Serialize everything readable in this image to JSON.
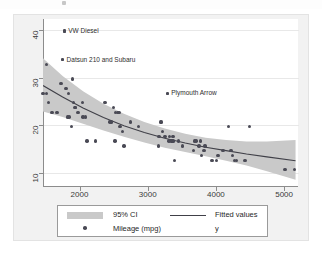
{
  "chart_data": {
    "type": "scatter",
    "title": "",
    "xlabel": "",
    "ylabel": "",
    "xlim": [
      1760,
      4880
    ],
    "ylim": [
      8.4,
      43.5
    ],
    "xticks": [
      2000,
      3000,
      4000,
      5000
    ],
    "yticks": [
      10,
      20,
      30,
      40
    ],
    "grid": "horizontal",
    "legend_position": "bottom",
    "series": [
      {
        "name": "Mileage (mpg)",
        "type": "scatter",
        "marker": "circle",
        "color": "#4a4a55",
        "points": [
          [
            1760,
            28
          ],
          [
            1800,
            28
          ],
          [
            1800,
            34
          ],
          [
            1830,
            26
          ],
          [
            1870,
            24
          ],
          [
            1930,
            24
          ],
          [
            1980,
            30
          ],
          [
            2000,
            35
          ],
          [
            2020,
            41
          ],
          [
            2040,
            29
          ],
          [
            2060,
            23
          ],
          [
            2070,
            28
          ],
          [
            2080,
            23
          ],
          [
            2110,
            21
          ],
          [
            2120,
            31
          ],
          [
            2130,
            26
          ],
          [
            2150,
            25
          ],
          [
            2160,
            25
          ],
          [
            2190,
            24
          ],
          [
            2240,
            26
          ],
          [
            2250,
            23
          ],
          [
            2280,
            23
          ],
          [
            2300,
            18
          ],
          [
            2400,
            18
          ],
          [
            2520,
            26
          ],
          [
            2580,
            22
          ],
          [
            2600,
            22
          ],
          [
            2620,
            25
          ],
          [
            2640,
            18
          ],
          [
            2650,
            24
          ],
          [
            2670,
            24
          ],
          [
            2690,
            24
          ],
          [
            2700,
            21
          ],
          [
            2730,
            20
          ],
          [
            2750,
            17
          ],
          [
            2830,
            22
          ],
          [
            2930,
            21
          ],
          [
            3170,
            17
          ],
          [
            3180,
            19
          ],
          [
            3200,
            22
          ],
          [
            3210,
            22
          ],
          [
            3220,
            20
          ],
          [
            3250,
            19
          ],
          [
            3260,
            19
          ],
          [
            3280,
            28
          ],
          [
            3300,
            18
          ],
          [
            3310,
            19
          ],
          [
            3330,
            18
          ],
          [
            3340,
            18
          ],
          [
            3350,
            19
          ],
          [
            3360,
            18
          ],
          [
            3370,
            14
          ],
          [
            3420,
            18
          ],
          [
            3470,
            17
          ],
          [
            3600,
            16
          ],
          [
            3610,
            18
          ],
          [
            3630,
            18
          ],
          [
            3670,
            17
          ],
          [
            3690,
            18
          ],
          [
            3700,
            15
          ],
          [
            3730,
            16
          ],
          [
            3740,
            17
          ],
          [
            3830,
            14
          ],
          [
            3880,
            14
          ],
          [
            3900,
            15
          ],
          [
            3960,
            16
          ],
          [
            4030,
            21
          ],
          [
            4060,
            16
          ],
          [
            4080,
            15
          ],
          [
            4100,
            14
          ],
          [
            4130,
            14
          ],
          [
            4230,
            14
          ],
          [
            4290,
            21
          ],
          [
            4720,
            12
          ],
          [
            4840,
            12
          ]
        ]
      },
      {
        "name": "Fitted values",
        "type": "line",
        "color": "#404048",
        "points": [
          [
            1760,
            29.6
          ],
          [
            2000,
            27.2
          ],
          [
            2250,
            24.9
          ],
          [
            2500,
            22.9
          ],
          [
            2750,
            21.2
          ],
          [
            3000,
            19.8
          ],
          [
            3250,
            18.6
          ],
          [
            3500,
            17.6
          ],
          [
            3750,
            16.7
          ],
          [
            4000,
            16.0
          ],
          [
            4250,
            15.3
          ],
          [
            4500,
            14.7
          ],
          [
            4850,
            13.9
          ]
        ]
      },
      {
        "name": "95% CI",
        "type": "band",
        "color": "#c9c9c9",
        "upper": [
          [
            1760,
            35.3
          ],
          [
            2000,
            31.6
          ],
          [
            2250,
            28.4
          ],
          [
            2500,
            25.8
          ],
          [
            2750,
            23.7
          ],
          [
            3000,
            22.0
          ],
          [
            3250,
            20.6
          ],
          [
            3500,
            19.5
          ],
          [
            3750,
            18.7
          ],
          [
            4000,
            18.2
          ],
          [
            4250,
            17.9
          ],
          [
            4500,
            17.9
          ],
          [
            4850,
            18.2
          ]
        ],
        "lower": [
          [
            1760,
            24.2
          ],
          [
            2000,
            23.0
          ],
          [
            2250,
            21.6
          ],
          [
            2500,
            20.2
          ],
          [
            2750,
            18.9
          ],
          [
            3000,
            17.7
          ],
          [
            3250,
            16.6
          ],
          [
            3500,
            15.7
          ],
          [
            3750,
            14.8
          ],
          [
            4000,
            13.9
          ],
          [
            4250,
            12.9
          ],
          [
            4500,
            11.7
          ],
          [
            4850,
            9.9
          ]
        ]
      }
    ],
    "annotations": [
      {
        "label": "VW Diesel",
        "x": 2020,
        "y": 41
      },
      {
        "label": "Datsun 210 and Subaru",
        "x": 2000,
        "y": 35
      },
      {
        "label": "Plymouth Arrow",
        "x": 3280,
        "y": 28
      }
    ]
  },
  "axes": {
    "x_tick_labels": [
      "2000",
      "3000",
      "4000",
      "5000"
    ],
    "y_tick_labels": [
      "10",
      "20",
      "30",
      "40"
    ]
  },
  "legend": {
    "items": [
      {
        "label": "95% CI",
        "swatch": "band-swatch"
      },
      {
        "label": "Fitted values",
        "swatch": "line-swatch"
      },
      {
        "label": "Mileage (mpg)",
        "swatch": "dot-swatch"
      },
      {
        "label": "y",
        "swatch": "none"
      }
    ]
  }
}
